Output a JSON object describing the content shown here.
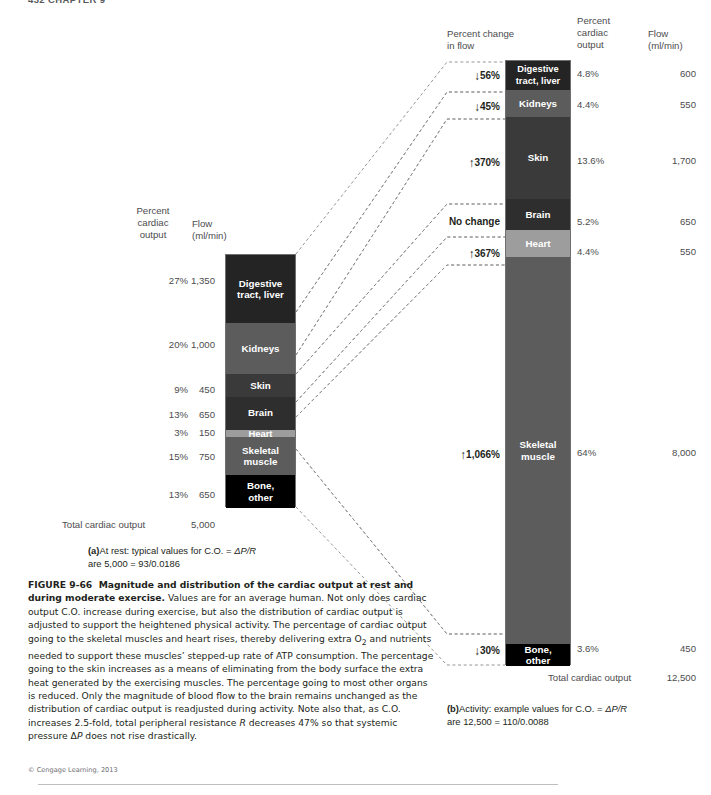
{
  "running_head": "432   CHAPTER 9",
  "rest_panel": {
    "headers": {
      "percent_cardiac_output": "Percent\ncardiac\noutput",
      "flow": "Flow\n(ml/min)"
    },
    "rows": [
      {
        "label": "Digestive\ntract, liver",
        "percent": "27%",
        "flow": "1,350",
        "color": "#242424",
        "share": 27
      },
      {
        "label": "Kidneys",
        "percent": "20%",
        "flow": "1,000",
        "color": "#5c5c5c",
        "share": 20
      },
      {
        "label": "Skin",
        "percent": "9%",
        "flow": "450",
        "color": "#3a3a3a",
        "share": 9
      },
      {
        "label": "Brain",
        "percent": "13%",
        "flow": "650",
        "color": "#2e2e2e",
        "share": 13
      },
      {
        "label": "Heart",
        "percent": "3%",
        "flow": "150",
        "color": "#9d9d9d",
        "share": 3
      },
      {
        "label": "Skeletal\nmuscle",
        "percent": "15%",
        "flow": "750",
        "color": "#5c5c5c",
        "share": 15
      },
      {
        "label": "Bone,\nother",
        "percent": "13%",
        "flow": "650",
        "color": "#000000",
        "share": 13
      }
    ],
    "total_label": "Total cardiac output",
    "total_value": "5,000",
    "caption_a_lead": "(a)",
    "caption_a_line1": "At rest: typical values for C.O. = ",
    "caption_a_formula": "ΔP/R",
    "caption_a_line2": "are 5,000 = 93/0.0186"
  },
  "exercise_panel": {
    "headers": {
      "percent_change": "Percent change\nin flow",
      "percent_cardiac_output": "Percent\ncardiac\noutput",
      "flow": "Flow\n(ml/min)"
    },
    "rows": [
      {
        "label": "Digestive\ntract, liver",
        "change": "56%",
        "direction": "down",
        "percent": "4.8%",
        "flow": "600",
        "color": "#242424",
        "share": 4.8
      },
      {
        "label": "Kidneys",
        "change": "45%",
        "direction": "down",
        "percent": "4.4%",
        "flow": "550",
        "color": "#5c5c5c",
        "share": 4.4
      },
      {
        "label": "Skin",
        "change": "370%",
        "direction": "up",
        "percent": "13.6%",
        "flow": "1,700",
        "color": "#3a3a3a",
        "share": 13.6
      },
      {
        "label": "Brain",
        "change": "No change",
        "direction": "none",
        "percent": "5.2%",
        "flow": "650",
        "color": "#2e2e2e",
        "share": 5.2
      },
      {
        "label": "Heart",
        "change": "367%",
        "direction": "up",
        "percent": "4.4%",
        "flow": "550",
        "color": "#9d9d9d",
        "share": 4.4
      },
      {
        "label": "Skeletal\nmuscle",
        "change": "1,066%",
        "direction": "up",
        "percent": "64%",
        "flow": "8,000",
        "color": "#5c5c5c",
        "share": 64
      },
      {
        "label": "Bone,\nother",
        "change": "30%",
        "direction": "down",
        "percent": "3.6%",
        "flow": "450",
        "color": "#000000",
        "share": 3.6
      }
    ],
    "total_label": "Total cardiac output",
    "total_value": "12,500",
    "caption_b_lead": "(b)",
    "caption_b_line1": "Activity: example values for C.O. = ",
    "caption_b_formula": "ΔP/R",
    "caption_b_line2": "are 12,500 = 110/0.0088"
  },
  "figure_caption": {
    "number": "FIGURE 9-66",
    "title": "Magnitude and distribution of the cardiac output at rest and during moderate exercise.",
    "body_1": " Values are for an average human. Not only does cardiac output C.O. increase during exercise, but also the distribution of cardiac output is adjusted to support the heightened physical activity. The percentage of cardiac output going to the skeletal muscles and heart rises, thereby delivering extra O",
    "body_sub": "2",
    "body_2": " and nutrients needed to support these muscles’ stepped-up rate of ATP consumption. The percentage going to the skin increases as a means of eliminating from the body surface the extra heat generated by the exercising muscles. The percentage going to most other organs is reduced. Only the magnitude of blood flow to the brain remains unchanged as the distribution of cardiac output is readjusted during activity. Note also that, as C.O. increases 2.5-fold, total peripheral resistance ",
    "body_italic_r": "R",
    "body_3": " decreases 47% so that systemic pressure Δ",
    "body_italic_p": "P",
    "body_4": " does not rise drastically."
  },
  "credit": "© Cengage Learning, 2013",
  "colors": {
    "text": "#231f20",
    "muted": "#4c4c4e",
    "connector": "#8a8a8a"
  }
}
